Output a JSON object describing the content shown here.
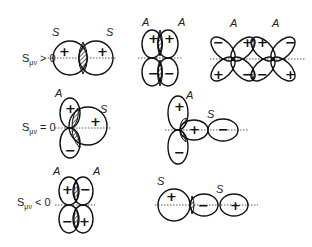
{
  "figure": {
    "rows": [
      {
        "condition": "S_μν > 0",
        "cond_main": "S",
        "cond_sub": "μν",
        "cond_rel": " > 0"
      },
      {
        "condition": "S_μν = 0",
        "cond_main": "S",
        "cond_sub": "μν",
        "cond_rel": " = 0"
      },
      {
        "condition": "S_μν < 0",
        "cond_main": "S",
        "cond_sub": "μν",
        "cond_rel": " < 0"
      }
    ],
    "panels": [
      {
        "id": "s-s",
        "labels": [
          "S",
          "S"
        ],
        "signs": [
          "+",
          "+"
        ]
      },
      {
        "id": "p-p-pi",
        "labels": [
          "A",
          "A"
        ],
        "signs": [
          "+",
          "+",
          "−",
          "−"
        ]
      },
      {
        "id": "d-d-delta",
        "labels": [
          "A",
          "A"
        ],
        "signs": [
          "−",
          "+",
          "+",
          "−",
          "+",
          "−",
          "−",
          "+"
        ]
      },
      {
        "id": "p-s-zero",
        "labels": [
          "A",
          "S"
        ],
        "signs": [
          "+",
          "+",
          "−"
        ]
      },
      {
        "id": "p-p-zero",
        "labels": [
          "A",
          "S"
        ],
        "signs": [
          "+",
          "+",
          "−",
          "−"
        ]
      },
      {
        "id": "p-p-neg",
        "labels": [
          "A",
          "A"
        ],
        "signs": [
          "+",
          "−",
          "−",
          "+"
        ]
      },
      {
        "id": "s-p-neg",
        "labels": [
          "S",
          "S"
        ],
        "signs": [
          "+",
          "−",
          "+"
        ]
      }
    ]
  }
}
